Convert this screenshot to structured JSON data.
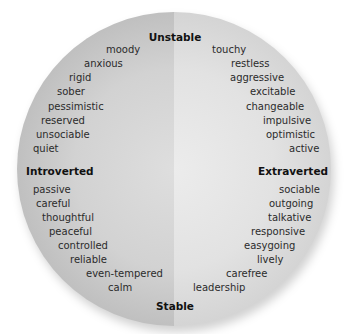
{
  "diagram": {
    "type": "personality-circle",
    "axes": {
      "top": "Unstable",
      "bottom": "Stable",
      "left": "Introverted",
      "right": "Extraverted"
    },
    "quadrants": {
      "unstable_introverted": [
        "moody",
        "anxious",
        "rigid",
        "sober",
        "pessimistic",
        "reserved",
        "unsociable",
        "quiet"
      ],
      "unstable_extraverted": [
        "touchy",
        "restless",
        "aggressive",
        "excitable",
        "changeable",
        "impulsive",
        "optimistic",
        "active"
      ],
      "stable_introverted": [
        "passive",
        "careful",
        "thoughtful",
        "peaceful",
        "controlled",
        "reliable",
        "even-tempered",
        "calm"
      ],
      "stable_extraverted": [
        "sociable",
        "outgoing",
        "talkative",
        "responsive",
        "easygoing",
        "lively",
        "carefree",
        "leadership"
      ]
    },
    "colors": {
      "left_half": "#d2d2d2",
      "right_half": "#e2e2e2",
      "text": "#2b2b2b",
      "axis_label": "#111111"
    }
  }
}
